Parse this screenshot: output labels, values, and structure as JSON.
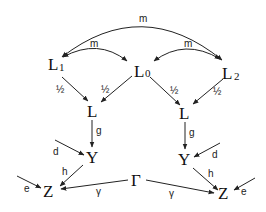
{
  "diagram": {
    "type": "directed-graph",
    "nodes": {
      "L1": {
        "label": "L",
        "sub": "1"
      },
      "L0": {
        "label": "L",
        "sub": "0"
      },
      "L2": {
        "label": "L",
        "sub": "2"
      },
      "L_left": {
        "label": "L"
      },
      "L_right": {
        "label": "L"
      },
      "Y_left": {
        "label": "Y"
      },
      "Y_right": {
        "label": "Y"
      },
      "Z_left": {
        "label": "Z"
      },
      "Z_right": {
        "label": "Z"
      },
      "Gamma": {
        "label": "Γ"
      }
    },
    "edges": {
      "m_top": {
        "from": "L2",
        "to": "L1",
        "bidirectional": true,
        "label": "m"
      },
      "m_left": {
        "from": "L0",
        "to": "L1",
        "bidirectional": true,
        "label": "m"
      },
      "m_right": {
        "from": "L0",
        "to": "L2",
        "bidirectional": true,
        "label": "m"
      },
      "L1_Lleft": {
        "from": "L1",
        "to": "L_left",
        "label": "½"
      },
      "L0_Lleft": {
        "from": "L0",
        "to": "L_left",
        "label": "½"
      },
      "L0_Lright": {
        "from": "L0",
        "to": "L_right",
        "label": "½"
      },
      "L2_Lright": {
        "from": "L2",
        "to": "L_right",
        "label": "½"
      },
      "g_left": {
        "from": "L_left",
        "to": "Y_left",
        "label": "g"
      },
      "g_right": {
        "from": "L_right",
        "to": "Y_right",
        "label": "g"
      },
      "d_left": {
        "from": "external",
        "to": "Y_left",
        "label": "d"
      },
      "d_right": {
        "from": "external",
        "to": "Y_right",
        "label": "d"
      },
      "h_left": {
        "from": "Y_left",
        "to": "Z_left",
        "label": "h"
      },
      "h_right": {
        "from": "Y_right",
        "to": "Z_right",
        "label": "h"
      },
      "e_left": {
        "from": "external",
        "to": "Z_left",
        "label": "e"
      },
      "e_right": {
        "from": "external",
        "to": "Z_right",
        "label": "e"
      },
      "gamma_left": {
        "from": "Gamma",
        "to": "Z_left",
        "label": "γ"
      },
      "gamma_right": {
        "from": "Gamma",
        "to": "Z_right",
        "label": "γ"
      }
    }
  }
}
